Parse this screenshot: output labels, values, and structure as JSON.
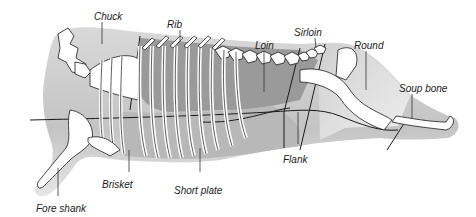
{
  "diagram": {
    "labels": [
      {
        "id": "chuck",
        "text": "Chuck",
        "x": 94,
        "y": 12
      },
      {
        "id": "rib",
        "text": "Rib",
        "x": 167,
        "y": 20
      },
      {
        "id": "loin",
        "text": "Loin",
        "x": 255,
        "y": 41
      },
      {
        "id": "sirloin",
        "text": "Sirloin",
        "x": 294,
        "y": 28
      },
      {
        "id": "round",
        "text": "Round",
        "x": 354,
        "y": 41
      },
      {
        "id": "soup_bone",
        "text": "Soup bone",
        "x": 399,
        "y": 84
      },
      {
        "id": "flank",
        "text": "Flank",
        "x": 283,
        "y": 155
      },
      {
        "id": "brisket",
        "text": "Brisket",
        "x": 102,
        "y": 180
      },
      {
        "id": "short_plate",
        "text": "Short plate",
        "x": 174,
        "y": 186
      },
      {
        "id": "fore_shank",
        "text": "Fore shank",
        "x": 36,
        "y": 204
      }
    ],
    "colors": {
      "background": "#ffffff",
      "light_meat": "#dcdcdc",
      "mid_meat": "#b4b4b4",
      "dark_meat": "#8c8c8c",
      "bone": "#ffffff",
      "outline": "#1a1a1a"
    }
  }
}
